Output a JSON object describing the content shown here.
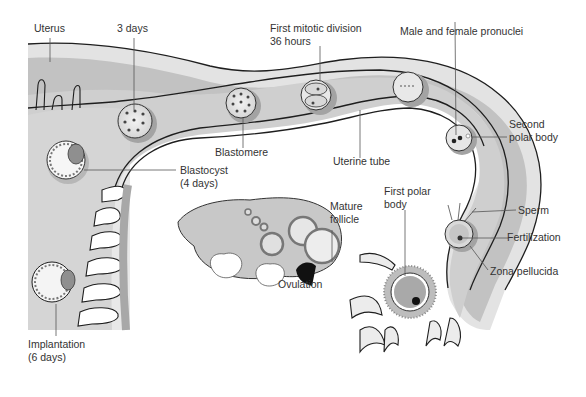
{
  "labels": {
    "uterus": "Uterus",
    "three_days": "3 days",
    "first_mitotic": [
      "First mitotic division",
      "36 hours"
    ],
    "pronuclei": "Male and female pronuclei",
    "second_polar": [
      "Second",
      "polar body"
    ],
    "blastomere": "Blastomere",
    "uterine_tube": "Uterine tube",
    "blastocyst": [
      "Blastocyst",
      "(4 days)"
    ],
    "mature_follicle": [
      "Mature",
      "follicle"
    ],
    "first_polar": [
      "First polar",
      "body"
    ],
    "sperm": "Sperm",
    "fertilization": "Fertilization",
    "zona": "Zona pellucida",
    "ovulation": "Ovulation",
    "implantation": [
      "Implantation",
      "(6 days)"
    ]
  },
  "colors": {
    "wall_outer": "#e4e4e4",
    "wall_mid": "#b9b9b9",
    "lumen": "#cfcfcf",
    "cavity": "#ececec",
    "ovary": "#c8c8c8",
    "outline": "#1e1e1e",
    "leader": "#555555"
  }
}
